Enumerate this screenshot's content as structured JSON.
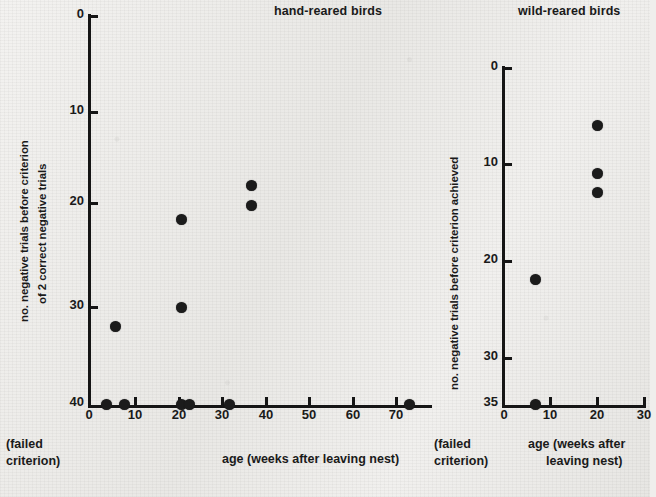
{
  "figure": {
    "background_color": "#eeedeb",
    "marker_color": "#1b1b1b"
  },
  "panels": {
    "left": {
      "title": "hand-reared birds",
      "ylabel_line1": "no. negative trials before criterion",
      "ylabel_line2": "of 2 correct negative trials",
      "xlabel": "age (weeks after leaving nest)",
      "failed_note_line1": "(failed",
      "failed_note_line2": "criterion)",
      "yticks": [
        "0",
        "10",
        "20",
        "30",
        "40"
      ],
      "xticks": [
        "0",
        "10",
        "20",
        "30",
        "40",
        "50",
        "60",
        "70"
      ]
    },
    "right": {
      "title": "wild-reared birds",
      "ylabel": "no. negative trials before criterion achieved",
      "xlabel_line1": "age (weeks after",
      "xlabel_line2": "leaving nest)",
      "failed_note_line1": "(failed",
      "failed_note_line2": "criterion)",
      "yticks": [
        "0",
        "10",
        "20",
        "30",
        "35"
      ],
      "xticks": [
        "0",
        "10",
        "20",
        "30"
      ]
    }
  },
  "chart_data": [
    {
      "type": "scatter",
      "title": "hand-reared birds",
      "xlabel": "age (weeks after leaving nest)",
      "ylabel": "no. negative trials before criterion of 2 correct negative trials",
      "xlim": [
        0,
        76
      ],
      "ylim": [
        0,
        40
      ],
      "y_inverted": true,
      "grid": false,
      "legend": "none",
      "xticks": [
        0,
        10,
        20,
        30,
        40,
        50,
        60,
        70
      ],
      "yticks": [
        0,
        10,
        20,
        30,
        40
      ],
      "y_axis_note": "40 = failed criterion",
      "points": [
        {
          "x": 4,
          "y": 40,
          "failed": true
        },
        {
          "x": 8,
          "y": 40,
          "failed": true
        },
        {
          "x": 21,
          "y": 40,
          "failed": true
        },
        {
          "x": 23,
          "y": 40,
          "failed": true
        },
        {
          "x": 32,
          "y": 40,
          "failed": true
        },
        {
          "x": 73,
          "y": 40,
          "failed": true
        },
        {
          "x": 6,
          "y": 32,
          "failed": false
        },
        {
          "x": 21,
          "y": 30,
          "failed": false
        },
        {
          "x": 21,
          "y": 21,
          "failed": false
        },
        {
          "x": 37,
          "y": 17.5,
          "failed": false
        },
        {
          "x": 37,
          "y": 19.5,
          "failed": false
        }
      ]
    },
    {
      "type": "scatter",
      "title": "wild-reared birds",
      "xlabel": "age (weeks after leaving nest)",
      "ylabel": "no. negative trials before criterion achieved",
      "xlim": [
        0,
        32
      ],
      "ylim": [
        0,
        35
      ],
      "y_inverted": true,
      "grid": false,
      "legend": "none",
      "xticks": [
        0,
        10,
        20,
        30
      ],
      "yticks": [
        0,
        10,
        20,
        30,
        35
      ],
      "y_axis_note": "35 = failed criterion",
      "points": [
        {
          "x": 7,
          "y": 35,
          "failed": true
        },
        {
          "x": 7,
          "y": 22,
          "failed": false
        },
        {
          "x": 20,
          "y": 6,
          "failed": false
        },
        {
          "x": 20,
          "y": 11,
          "failed": false
        },
        {
          "x": 20,
          "y": 13,
          "failed": false
        }
      ]
    }
  ]
}
